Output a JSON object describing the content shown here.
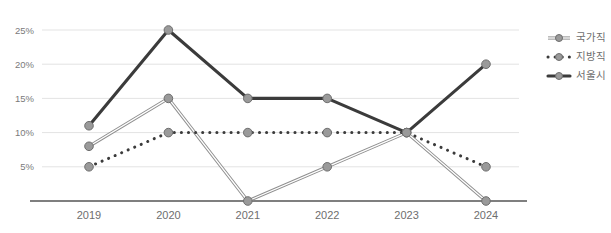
{
  "chart_data": {
    "type": "line",
    "title": "",
    "subtitle": "",
    "xlabel": "",
    "ylabel": "",
    "categories": [
      "2019",
      "2020",
      "2021",
      "2022",
      "2023",
      "2024"
    ],
    "ylim": [
      0,
      26.5
    ],
    "yticks": [
      5,
      10,
      15,
      20,
      25
    ],
    "ytick_labels": [
      "5%",
      "10%",
      "15%",
      "20%",
      "25%"
    ],
    "grid": true,
    "grid_axis": "y",
    "legend_position": "right",
    "series": [
      {
        "name": "국가직",
        "values": [
          8,
          15,
          0,
          5,
          10,
          0
        ],
        "line_style": "double",
        "color": "#8f8f8f",
        "marker": "circle"
      },
      {
        "name": "지방직",
        "values": [
          5,
          10,
          10,
          10,
          10,
          5
        ],
        "line_style": "dotted",
        "color": "#3b3b3b",
        "marker": "circle"
      },
      {
        "name": "서울시",
        "values": [
          11,
          25,
          15,
          15,
          10,
          20
        ],
        "line_style": "solid",
        "color": "#3b3b3b",
        "marker": "circle"
      }
    ]
  },
  "axis": {
    "baseline_color": "#555555",
    "grid_color": "#e3e3e3",
    "tick_label_color": "#7a7a7a"
  },
  "legend": {
    "items": [
      {
        "label": "국가직"
      },
      {
        "label": "지방직"
      },
      {
        "label": "서울시"
      }
    ]
  }
}
